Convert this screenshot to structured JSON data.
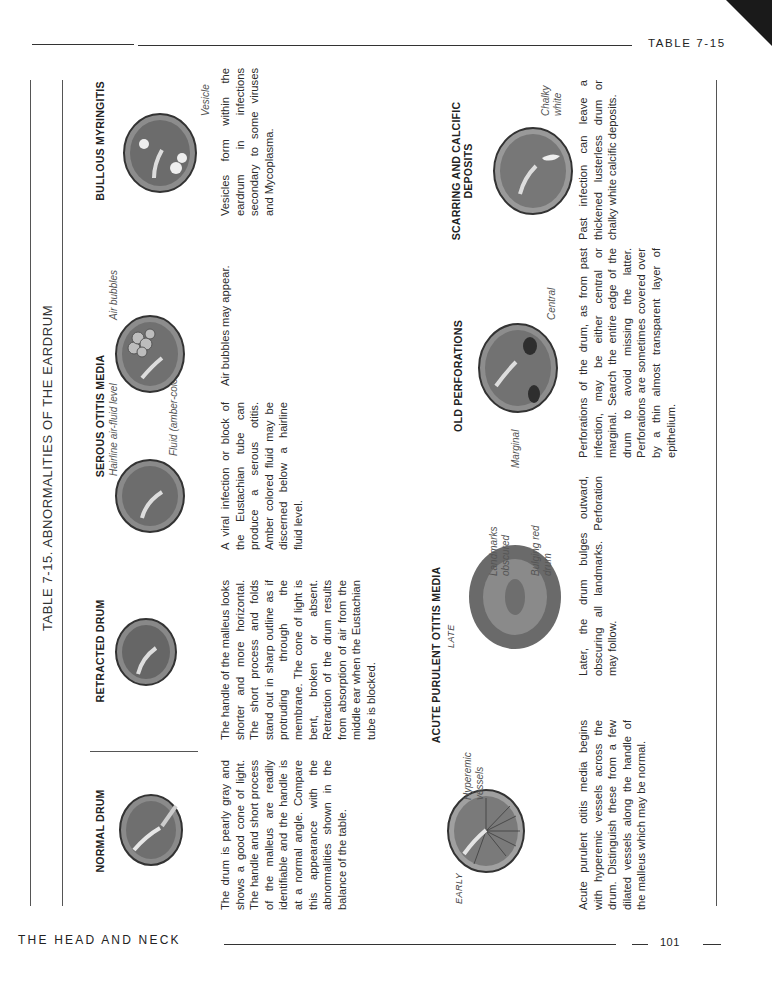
{
  "running_head": {
    "table_ref": "TABLE 7-15",
    "section": "THE HEAD AND NECK",
    "page_number": "101"
  },
  "table_title": "TABLE 7-15. ABNORMALITIES OF THE EARDRUM",
  "top_row": [
    {
      "heading": "NORMAL DRUM",
      "text": "The drum is pearly gray and shows a good cone of light. The handle and short process of the malleus are readily identifiable and the handle is at a normal angle. Compare this appearance with the abnormalities shown in the balance of the table.",
      "labels": []
    },
    {
      "heading": "RETRACTED DRUM",
      "text": "The handle of the malleus looks shorter and more horizontal. The short process and folds stand out in sharp outline as if protruding through the membrane. The cone of light is bent, broken or absent. Retraction of the drum results from absorption of air from the middle ear when the Eustachian tube is blocked.",
      "labels": []
    },
    {
      "heading": "SEROUS OTITIS MEDIA",
      "text": "A viral infection or block of the Eustachian tube can produce a serous otitis. Amber colored fluid may be discerned below a hairline fluid level.",
      "text2": "Air bubbles may appear.",
      "labels": [
        "Hairline air-fluid level",
        "Fluid (amber-colored)",
        "Air bubbles"
      ]
    },
    {
      "heading": "BULLOUS MYRINGITIS",
      "text": "Vesicles form within the eardrum in infections secondary to some viruses and Mycoplasma.",
      "labels": [
        "Vesicle"
      ]
    }
  ],
  "bottom_row": [
    {
      "heading": "ACUTE PURULENT OTITIS MEDIA",
      "stage_early": "EARLY",
      "stage_late": "LATE",
      "text_early": "Acute purulent otitis media begins with hyperemic vessels across the drum. Distinguish these from a few dilated vessels along the handle of the malleus which may be normal.",
      "text_late": "Later, the drum bulges outward, obscuring all landmarks. Perforation may follow.",
      "labels": [
        "Hyperemic vessels",
        "Landmarks obscured",
        "Bulging red drum"
      ]
    },
    {
      "heading": "OLD PERFORATIONS",
      "text": "Perforations of the drum, as from past infection, may be either central or marginal. Search the entire edge of the drum to avoid missing the latter. Perforations are sometimes covered over by a thin almost transparent layer of epithelium.",
      "labels": [
        "Marginal",
        "Central"
      ]
    },
    {
      "heading": "SCARRING AND CALCIFIC DEPOSITS",
      "text": "Past infection can leave a thickened lusterless drum or chalky white calcific deposits.",
      "labels": [
        "Chalky white"
      ]
    }
  ],
  "icons": [
    "eardrum-illustration"
  ]
}
